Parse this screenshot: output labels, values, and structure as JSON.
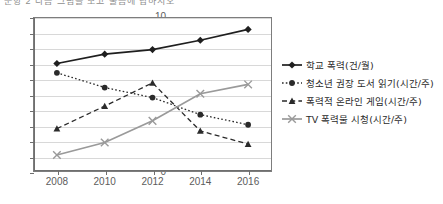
{
  "caption": "문항 2 다음 그림을 보고 물음에 답하시오",
  "chart_data": {
    "type": "line",
    "title": "",
    "subtitle": "",
    "xlabel": "",
    "ylabel": "",
    "categories": [
      "2008",
      "2010",
      "2012",
      "2014",
      "2016"
    ],
    "ylim": [
      0,
      10
    ],
    "ytick_step": 1,
    "yticks": [
      "0",
      "1",
      "2",
      "3",
      "4",
      "5",
      "6",
      "7",
      "8",
      "9",
      "10"
    ],
    "grid": true,
    "legend_position": "right",
    "series": [
      {
        "name": "학교 폭력(건/월)",
        "marker": "diamond",
        "linestyle": "solid",
        "color": "#1f1f1f",
        "values": [
          7.0,
          7.6,
          7.9,
          8.5,
          9.2
        ]
      },
      {
        "name": "청소년 권장 도서 읽기(시간/주)",
        "marker": "circle",
        "linestyle": "dotted",
        "color": "#2b2b2b",
        "values": [
          6.4,
          5.45,
          4.8,
          3.7,
          3.05
        ]
      },
      {
        "name": "폭력적 온라인 게임(시간/주)",
        "marker": "triangle",
        "linestyle": "dashed",
        "color": "#2b2b2b",
        "values": [
          2.8,
          4.25,
          5.75,
          2.65,
          1.8
        ]
      },
      {
        "name": "TV 폭력물 시청(시간/주)",
        "marker": "x",
        "linestyle": "solid",
        "color": "#9a9a9a",
        "values": [
          1.1,
          1.9,
          3.3,
          5.05,
          5.65
        ]
      }
    ]
  }
}
